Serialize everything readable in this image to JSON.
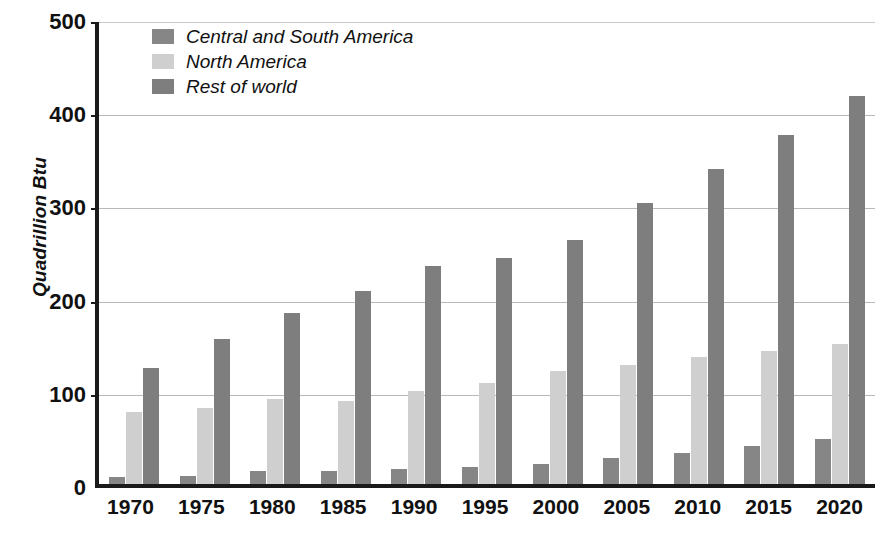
{
  "chart_data": {
    "type": "bar",
    "title": "",
    "xlabel": "",
    "ylabel": "Quadrillion Btu",
    "ylim": [
      0,
      500
    ],
    "yticks": [
      0,
      100,
      200,
      300,
      400,
      500
    ],
    "grid": true,
    "legend_position": "top-left",
    "categories": [
      "1970",
      "1975",
      "1980",
      "1985",
      "1990",
      "1995",
      "2000",
      "2005",
      "2010",
      "2015",
      "2020"
    ],
    "series": [
      {
        "name": "Central and South America",
        "color": "#868686",
        "values": [
          8,
          9,
          14,
          14,
          16,
          18,
          22,
          28,
          33,
          41,
          48
        ]
      },
      {
        "name": "North America",
        "color": "#cfcfcf",
        "values": [
          77,
          82,
          91,
          89,
          100,
          108,
          121,
          128,
          136,
          143,
          150
        ]
      },
      {
        "name": "Rest of world",
        "color": "#7e7e7e",
        "values": [
          125,
          156,
          183,
          207,
          234,
          243,
          262,
          301,
          338,
          374,
          416
        ]
      }
    ]
  },
  "axes": {
    "y_title": "Quadrillion Btu"
  }
}
